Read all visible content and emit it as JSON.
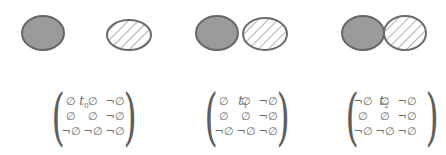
{
  "diagram": {
    "colors": {
      "solid_fill": "#9a9a9a",
      "outline": "#6b6b6b",
      "hatch": "#7a7a7a"
    },
    "panels": [
      {
        "time_label": "t",
        "time_index": "0",
        "relation": "disjoint",
        "matrix": [
          [
            "∅",
            "∅",
            "¬∅"
          ],
          [
            "∅",
            "∅",
            "¬∅"
          ],
          [
            "¬∅",
            "¬∅",
            "¬∅"
          ]
        ]
      },
      {
        "time_label": "t",
        "time_index": "1",
        "relation": "disjoint (close)",
        "matrix": [
          [
            "∅",
            "∅",
            "¬∅"
          ],
          [
            "∅",
            "∅",
            "¬∅"
          ],
          [
            "¬∅",
            "¬∅",
            "¬∅"
          ]
        ]
      },
      {
        "time_label": "t",
        "time_index": "2",
        "relation": "meet",
        "matrix": [
          [
            "¬∅",
            "∅",
            "¬∅"
          ],
          [
            "∅",
            "∅",
            "¬∅"
          ],
          [
            "¬∅",
            "¬∅",
            "¬∅"
          ]
        ]
      }
    ]
  }
}
